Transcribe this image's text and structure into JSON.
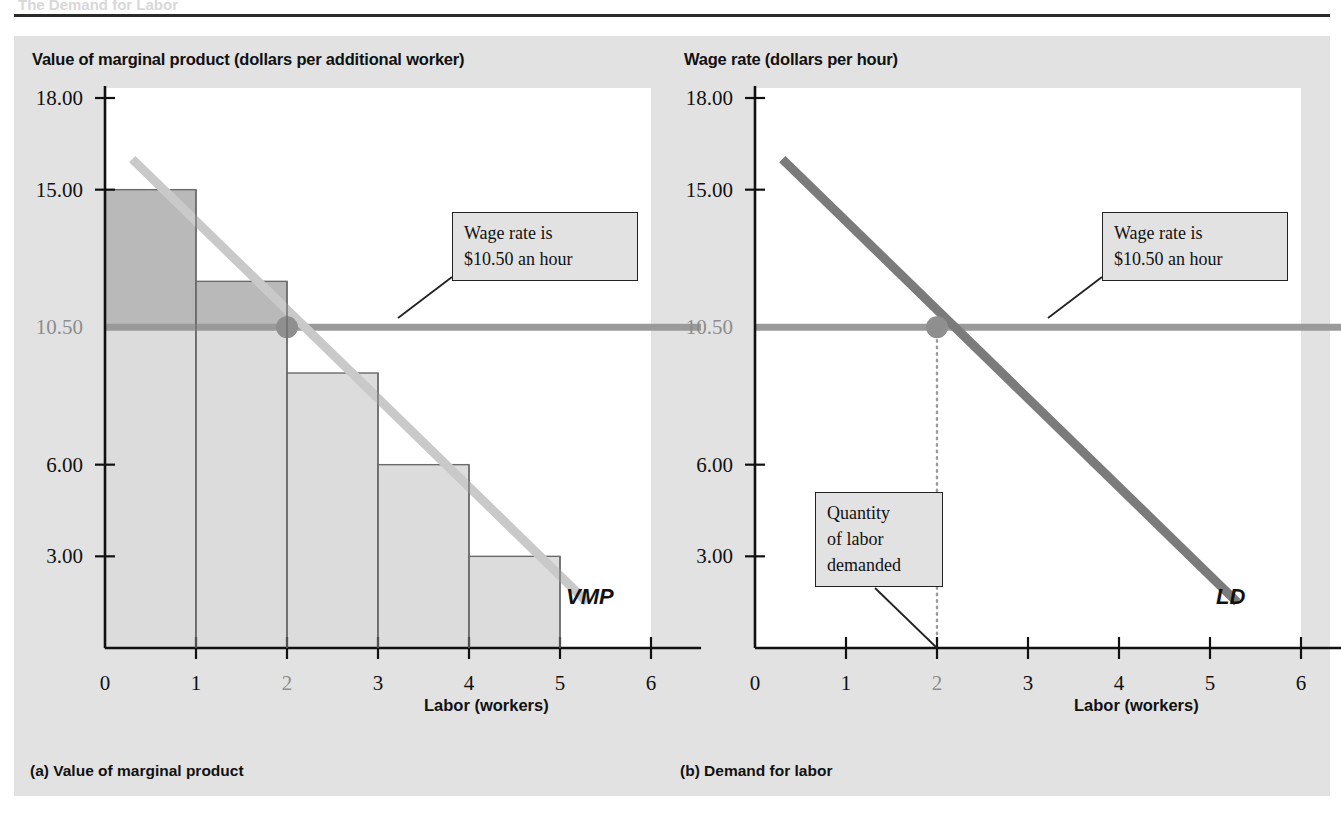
{
  "figure": {
    "top_partial_heading": "The Demand for Labor",
    "panels": [
      {
        "id": "a",
        "caption": "(a) Value of marginal product",
        "y_axis_title": "Value of marginal product (dollars per additional worker)",
        "x_axis_title": "Labor (workers)",
        "curve_label": "VMP",
        "callout_lines": [
          "Wage rate is",
          "$10.50 an hour"
        ]
      },
      {
        "id": "b",
        "caption": "(b) Demand for labor",
        "y_axis_title": "Wage rate (dollars per hour)",
        "x_axis_title": "Labor (workers)",
        "curve_label": "LD",
        "callout_lines": [
          "Wage rate is",
          "$10.50 an hour"
        ],
        "callout2_lines": [
          "Quantity",
          "of labor",
          "demanded"
        ]
      }
    ],
    "colors": {
      "panel_background": "#e2e2e2",
      "plot_background": "#ffffff",
      "axis": "#111111",
      "bar_fill_below_wage": "#dcdcdc",
      "bar_fill_above_wage": "#b9b9b9",
      "bar_stroke": "#6b6b6b",
      "vmp_curve": "#c9c9c9",
      "ld_curve": "#7b7b7b",
      "wage_line": "#9a9a9a",
      "intersection_dot": "#8f8f8f",
      "muted_tick": "#8d8d8d"
    }
  },
  "chart_data": [
    {
      "type": "bar",
      "id": "panel-a",
      "title": "Value of marginal product",
      "xlabel": "Labor (workers)",
      "ylabel": "Value of marginal product (dollars per additional worker)",
      "categories": [
        "1",
        "2",
        "3",
        "4",
        "5"
      ],
      "values": [
        15.0,
        12.0,
        9.0,
        6.0,
        3.0
      ],
      "xlim": [
        0,
        6
      ],
      "ylim": [
        0,
        19.5
      ],
      "xticks": [
        "0",
        "1",
        "2",
        "3",
        "4",
        "5",
        "6"
      ],
      "yticks": [
        "18.00",
        "15.00",
        "10.50",
        "6.00",
        "3.00"
      ],
      "ytick_values": [
        18.0,
        15.0,
        10.5,
        6.0,
        3.0
      ],
      "muted_xtick": "2",
      "muted_ytick": "10.50",
      "grid": false,
      "legend": "none",
      "series": [
        {
          "name": "VMP",
          "type": "line",
          "points": [
            [
              0.3,
              16.0
            ],
            [
              5.3,
              1.5
            ]
          ],
          "label": "VMP"
        },
        {
          "name": "Wage rate",
          "type": "hline",
          "value": 10.5,
          "label": "Wage rate is $10.50 an hour"
        }
      ],
      "annotations": [
        {
          "text": "Wage rate is $10.50 an hour",
          "points_to": "wage-line"
        },
        {
          "text": "VMP",
          "points_to": "vmp-curve"
        }
      ],
      "intersection": {
        "x": 2,
        "y": 10.5
      }
    },
    {
      "type": "line",
      "id": "panel-b",
      "title": "Demand for labor",
      "xlabel": "Labor (workers)",
      "ylabel": "Wage rate (dollars per hour)",
      "xlim": [
        0,
        6
      ],
      "ylim": [
        0,
        19.5
      ],
      "xticks": [
        "0",
        "1",
        "2",
        "3",
        "4",
        "5",
        "6"
      ],
      "yticks": [
        "18.00",
        "15.00",
        "10.50",
        "6.00",
        "3.00"
      ],
      "ytick_values": [
        18.0,
        15.0,
        10.5,
        6.0,
        3.0
      ],
      "muted_xtick": "2",
      "muted_ytick": "10.50",
      "grid": false,
      "legend": "none",
      "series": [
        {
          "name": "LD",
          "type": "line",
          "points": [
            [
              0.3,
              16.0
            ],
            [
              5.3,
              1.5
            ]
          ],
          "label": "LD"
        },
        {
          "name": "Wage rate",
          "type": "hline",
          "value": 10.5,
          "label": "Wage rate is $10.50 an hour"
        }
      ],
      "annotations": [
        {
          "text": "Wage rate is $10.50 an hour",
          "points_to": "wage-line"
        },
        {
          "text": "Quantity of labor demanded",
          "points_to": "x=2"
        },
        {
          "text": "LD",
          "points_to": "ld-curve"
        }
      ],
      "intersection": {
        "x": 2,
        "y": 10.5
      },
      "quantity_demanded": 2
    }
  ]
}
